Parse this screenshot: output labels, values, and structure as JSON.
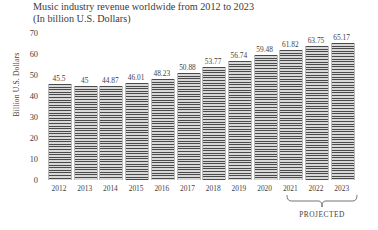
{
  "chart_data": {
    "type": "bar",
    "title": "Music industry revenue worldwide from 2012 to 2023",
    "subtitle": "(In billion U.S. Dollars)",
    "xlabel": "",
    "ylabel": "Billion U.S. Dollars",
    "ylim": [
      0,
      70
    ],
    "yticks": [
      70,
      60,
      50,
      40,
      30,
      20,
      10,
      0
    ],
    "grid": false,
    "legend": "none",
    "categories": [
      "2012",
      "2013",
      "2014",
      "2015",
      "2016",
      "2017",
      "2018",
      "2019",
      "2020",
      "2021",
      "2022",
      "2023"
    ],
    "values": [
      45.5,
      45,
      44.87,
      46.01,
      48.23,
      50.88,
      53.77,
      56.74,
      59.48,
      61.82,
      63.75,
      65.17
    ],
    "value_labels": [
      "45.5",
      "45",
      "44.87",
      "46.01",
      "48.23",
      "50.88",
      "53.77",
      "56.74",
      "59.48",
      "61.82",
      "63.75",
      "65.17"
    ],
    "annotations": [
      {
        "text": "PROJECTED",
        "covers": [
          "2021",
          "2022",
          "2023"
        ],
        "style": "curly-brace-below-axis"
      }
    ],
    "bar_style": {
      "fill": "#d8d8d8",
      "hatch": "horizontal-lines",
      "hatch_color": "#4a4a4a"
    }
  },
  "annotation": {
    "projected_label": "PROJECTED"
  }
}
